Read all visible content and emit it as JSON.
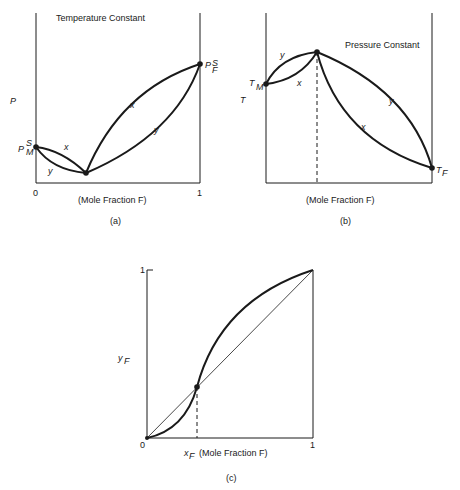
{
  "panels": {
    "a": {
      "title": "Temperature Constant",
      "ylabel": "P",
      "xlabel": "(Mole Fraction  F)",
      "caption": "(a)",
      "tick_0": "0",
      "tick_1": "1",
      "pm": "P",
      "pm_sup": "S",
      "pm_sub": "M",
      "pf": "P",
      "pf_sup": "S",
      "pf_sub": "F",
      "curve_x": "x",
      "curve_y": "y"
    },
    "b": {
      "title": "Pressure Constant",
      "ylabel": "T",
      "xlabel": "(Mole Fraction  F)",
      "caption": "(b)",
      "tm": "T",
      "tm_sub": "M",
      "tf": "T",
      "tf_sub": "F",
      "curve_x": "x",
      "curve_y": "y"
    },
    "c": {
      "ylabel": "y",
      "ylabel_sub": "F",
      "xlabel_var": "x",
      "xlabel_sub": "F",
      "xlabel": "(Mole Fraction  F)",
      "caption": "(c)",
      "tick_0": "0",
      "tick_1x": "1",
      "tick_1y": "1"
    }
  }
}
